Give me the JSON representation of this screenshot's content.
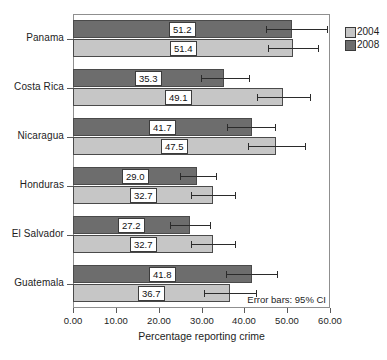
{
  "chart_data": {
    "type": "bar",
    "orientation": "horizontal",
    "title": "",
    "xlabel": "Percentage reporting crime",
    "ylabel": "",
    "xlim": [
      0,
      60
    ],
    "xticks": [
      "0.00",
      "10.00",
      "20.00",
      "30.00",
      "40.00",
      "50.00",
      "60.00"
    ],
    "xtick_values": [
      0,
      10,
      20,
      30,
      40,
      50,
      60
    ],
    "categories": [
      "Panama",
      "Costa Rica",
      "Nicaragua",
      "Honduras",
      "El Salvador",
      "Guatemala"
    ],
    "grid": false,
    "legend_position": "right-top",
    "annotation": "Error bars: 95% CI",
    "series": [
      {
        "name": "2004",
        "color": "#c6c6c6",
        "values": [
          51.4,
          49.1,
          47.5,
          32.7,
          32.7,
          36.7
        ],
        "labels": [
          "51.4",
          "49.1",
          "47.5",
          "32.7",
          "32.7",
          "36.7"
        ],
        "ci_low": [
          45.5,
          42.9,
          40.8,
          27.6,
          27.5,
          30.6
        ],
        "ci_high": [
          57.3,
          55.3,
          54.2,
          37.8,
          37.9,
          42.8
        ]
      },
      {
        "name": "2008",
        "color": "#6d6d6d",
        "values": [
          51.2,
          35.3,
          41.7,
          29.0,
          27.2,
          41.8
        ],
        "labels": [
          "51.2",
          "35.3",
          "41.7",
          "29.0",
          "27.2",
          "41.8"
        ],
        "ci_low": [
          45.0,
          29.8,
          36.0,
          24.9,
          22.6,
          35.8
        ],
        "ci_high": [
          59.4,
          41.2,
          47.2,
          33.3,
          31.9,
          47.6
        ]
      }
    ]
  },
  "legend": {
    "items": [
      {
        "label": "2004",
        "color": "#c6c6c6"
      },
      {
        "label": "2008",
        "color": "#6d6d6d"
      }
    ]
  },
  "axis": {
    "x_title": "Percentage reporting crime",
    "tick_0": "0.00",
    "tick_1": "10.00",
    "tick_2": "20.00",
    "tick_3": "30.00",
    "tick_4": "40.00",
    "tick_5": "50.00",
    "tick_6": "60.00"
  },
  "note": {
    "error_bars": "Error bars: 95% CI"
  },
  "colors": {
    "series_2004": "#c6c6c6",
    "series_2008": "#6d6d6d",
    "frame": "#8f8f8f",
    "errorbar": "#2b2b2b",
    "text": "#1d1d1d"
  }
}
